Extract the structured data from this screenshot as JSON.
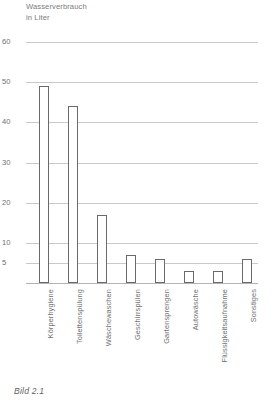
{
  "caption": "Bild 2.1",
  "chart_data": {
    "type": "bar",
    "title": "",
    "ylabel": "Wasserverbrauch\nin Liter",
    "xlabel": "",
    "categories": [
      "Körperhygiene",
      "Toilettenspülung",
      "Wäschewaschen",
      "Geschirrspülen",
      "Gartensprengen",
      "Autowäsche",
      "Flüssigkeitsaufnahme",
      "Sonstiges"
    ],
    "values": [
      49,
      44,
      17,
      7,
      6,
      3,
      3,
      6
    ],
    "ylim": [
      0,
      60
    ],
    "yticks": [
      60,
      50,
      40,
      30,
      20,
      10,
      5
    ],
    "grid": true,
    "legend": "none",
    "bar_color": "#ffffff",
    "bar_edge_color": "#6a6a6a",
    "grid_color": "#c9c9c9"
  }
}
